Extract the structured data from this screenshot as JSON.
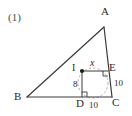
{
  "problem": {
    "number": "(1)"
  },
  "figure": {
    "type": "geometry-diagram",
    "stroke_color": "#3a3a3a",
    "dashed_color": "#8a8a8a",
    "vertices": [
      {
        "id": "A",
        "label": "A",
        "x": 104,
        "y": 20
      },
      {
        "id": "B",
        "label": "B",
        "x": 18,
        "y": 98
      },
      {
        "id": "C",
        "label": "C",
        "x": 112,
        "y": 98
      },
      {
        "id": "D",
        "label": "D",
        "x": 84,
        "y": 98
      },
      {
        "id": "E",
        "label": "E",
        "x": 107,
        "y": 70
      },
      {
        "id": "I",
        "label": "I",
        "x": 80,
        "y": 70
      }
    ],
    "segments": [
      {
        "from": "B",
        "to": "A"
      },
      {
        "from": "A",
        "to": "C"
      },
      {
        "from": "B",
        "to": "C"
      },
      {
        "from": "I",
        "to": "E"
      },
      {
        "from": "I",
        "to": "D"
      },
      {
        "from": "D",
        "to": "C"
      },
      {
        "from": "E",
        "to": "C"
      }
    ],
    "measure_labels": [
      {
        "text": "x",
        "near": "IE",
        "x": 90,
        "y": 63
      },
      {
        "text": "8",
        "near": "ID",
        "x": 75,
        "y": 85
      },
      {
        "text": "10",
        "near": "EC",
        "x": 116,
        "y": 83
      },
      {
        "text": "10",
        "near": "DC",
        "x": 94,
        "y": 103
      }
    ],
    "right_angles": [
      {
        "at": "E",
        "note": "angle IEC"
      },
      {
        "at": "D",
        "note": "angle IDC"
      }
    ],
    "incircle": {
      "center": "I",
      "style": "dashed",
      "cx": 93,
      "cy": 83,
      "r": 15
    },
    "center_dot": {
      "at": "I",
      "cx": 82,
      "cy": 71,
      "r": 2
    }
  }
}
